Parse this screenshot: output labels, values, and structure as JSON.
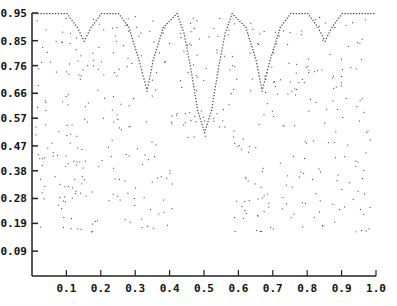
{
  "chart_data": {
    "type": "scatter",
    "title": "",
    "xlabel": "",
    "ylabel": "",
    "xlim": [
      0,
      1.0
    ],
    "ylim": [
      0,
      0.95
    ],
    "grid": false,
    "legend": null,
    "x_ticks": [
      "0.1",
      "0.2",
      "0.3",
      "0.4",
      "0.5",
      "0.6",
      "0.7",
      "0.8",
      "0.9",
      "1.0"
    ],
    "y_ticks": [
      "0.95",
      "0.85",
      "0.76",
      "0.66",
      "0.57",
      "0.47",
      "0.38",
      "0.28",
      "0.19",
      "0.09"
    ],
    "note": "Dotted plot. Main envelope curve reaches 0.95 at multiple points with approximate dips: ~0.52 at x=0.5, ~0.67 near x=0.33 and x=0.67, ~0.85 spikes near x=0.15 and x=0.85. Remaining scattered dots (roughly 0.15-0.95) are illustrative approximations, not exact data.",
    "series": [
      {
        "name": "envelope",
        "description": "approximate dotted main curve",
        "x": [
          0.0,
          0.05,
          0.1,
          0.13,
          0.15,
          0.17,
          0.2,
          0.25,
          0.28,
          0.31,
          0.333,
          0.35,
          0.38,
          0.42,
          0.44,
          0.46,
          0.48,
          0.5,
          0.52,
          0.54,
          0.56,
          0.58,
          0.62,
          0.65,
          0.667,
          0.69,
          0.72,
          0.75,
          0.8,
          0.83,
          0.85,
          0.87,
          0.9,
          0.95,
          1.0
        ],
        "y": [
          0.95,
          0.95,
          0.95,
          0.9,
          0.85,
          0.9,
          0.95,
          0.95,
          0.9,
          0.78,
          0.67,
          0.78,
          0.9,
          0.95,
          0.88,
          0.75,
          0.6,
          0.52,
          0.6,
          0.75,
          0.88,
          0.95,
          0.9,
          0.78,
          0.67,
          0.78,
          0.9,
          0.95,
          0.95,
          0.9,
          0.85,
          0.9,
          0.95,
          0.95,
          0.95
        ]
      }
    ]
  }
}
